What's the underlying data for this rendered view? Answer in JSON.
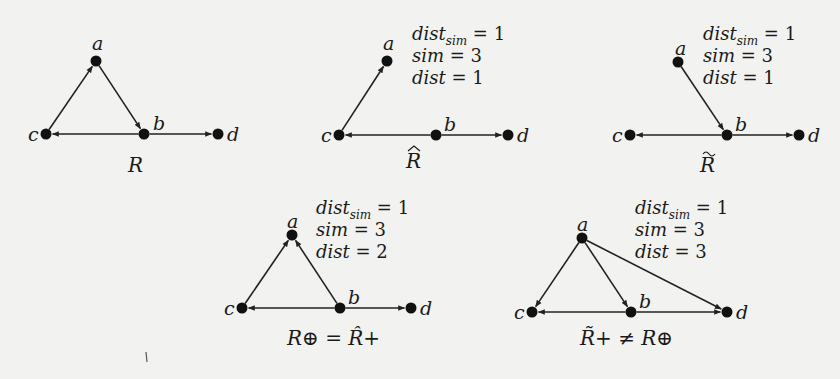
{
  "figure": {
    "background": "#f2f2f0",
    "ink_color": "#1a1a1a",
    "graphs": [
      {
        "id": "R",
        "caption": "R",
        "caption_x": 128,
        "caption_y": 172,
        "nodes": [
          {
            "name": "a",
            "x": 96,
            "y": 61,
            "lx": 92,
            "ly": 50
          },
          {
            "name": "b",
            "x": 144,
            "y": 134,
            "lx": 153,
            "ly": 130
          },
          {
            "name": "c",
            "x": 46,
            "y": 134,
            "lx": 28,
            "ly": 141
          },
          {
            "name": "d",
            "x": 218,
            "y": 134,
            "lx": 227,
            "ly": 141
          }
        ],
        "edges": [
          {
            "from": "c",
            "to": "a"
          },
          {
            "from": "a",
            "to": "b"
          },
          {
            "from": "b",
            "to": "c"
          },
          {
            "from": "b",
            "to": "d"
          }
        ],
        "stats": null
      },
      {
        "id": "R-hat",
        "caption": "R",
        "caption_accent": "hat",
        "caption_x": 406,
        "caption_y": 168,
        "nodes": [
          {
            "name": "a",
            "x": 387,
            "y": 61,
            "lx": 383,
            "ly": 50
          },
          {
            "name": "b",
            "x": 436,
            "y": 135,
            "lx": 444,
            "ly": 131
          },
          {
            "name": "c",
            "x": 339,
            "y": 135,
            "lx": 321,
            "ly": 142
          },
          {
            "name": "d",
            "x": 508,
            "y": 135,
            "lx": 517,
            "ly": 142
          }
        ],
        "edges": [
          {
            "from": "c",
            "to": "a"
          },
          {
            "from": "b",
            "to": "c"
          },
          {
            "from": "b",
            "to": "d"
          }
        ],
        "stats": {
          "x": 412,
          "dist_sim": "1",
          "sim": "3",
          "dist": "1",
          "y0": 40
        }
      },
      {
        "id": "R-tilde",
        "caption": "R",
        "caption_accent": "tilde",
        "caption_x": 700,
        "caption_y": 172,
        "nodes": [
          {
            "name": "a",
            "x": 678,
            "y": 62,
            "lx": 675,
            "ly": 55
          },
          {
            "name": "b",
            "x": 727,
            "y": 135,
            "lx": 735,
            "ly": 131
          },
          {
            "name": "c",
            "x": 630,
            "y": 135,
            "lx": 612,
            "ly": 142
          },
          {
            "name": "d",
            "x": 799,
            "y": 135,
            "lx": 808,
            "ly": 142
          }
        ],
        "edges": [
          {
            "from": "a",
            "to": "b"
          },
          {
            "from": "b",
            "to": "c"
          },
          {
            "from": "b",
            "to": "d"
          }
        ],
        "stats": {
          "x": 703,
          "dist_sim": "1",
          "sim": "3",
          "dist": "1",
          "y0": 40
        }
      },
      {
        "id": "R-oplus",
        "caption": "R⊕ = R̂+",
        "caption_x": 287,
        "caption_y": 345,
        "nodes": [
          {
            "name": "a",
            "x": 292,
            "y": 235,
            "lx": 287,
            "ly": 228
          },
          {
            "name": "b",
            "x": 340,
            "y": 308,
            "lx": 348,
            "ly": 304
          },
          {
            "name": "c",
            "x": 242,
            "y": 308,
            "lx": 224,
            "ly": 315
          },
          {
            "name": "d",
            "x": 411,
            "y": 308,
            "lx": 420,
            "ly": 315
          }
        ],
        "edges": [
          {
            "from": "c",
            "to": "a"
          },
          {
            "from": "b",
            "to": "a"
          },
          {
            "from": "b",
            "to": "c"
          },
          {
            "from": "b",
            "to": "d"
          }
        ],
        "stats": {
          "x": 316,
          "dist_sim": "1",
          "sim": "3",
          "dist": "2",
          "y0": 214
        }
      },
      {
        "id": "R-tilde-plus",
        "caption": "R̃+ ≠ R⊕",
        "caption_x": 580,
        "caption_y": 345,
        "nodes": [
          {
            "name": "a",
            "x": 582,
            "y": 238,
            "lx": 577,
            "ly": 231
          },
          {
            "name": "b",
            "x": 631,
            "y": 312,
            "lx": 639,
            "ly": 308
          },
          {
            "name": "c",
            "x": 532,
            "y": 312,
            "lx": 514,
            "ly": 319
          },
          {
            "name": "d",
            "x": 727,
            "y": 312,
            "lx": 736,
            "ly": 319
          }
        ],
        "edges": [
          {
            "from": "a",
            "to": "c"
          },
          {
            "from": "a",
            "to": "b"
          },
          {
            "from": "a",
            "to": "d"
          },
          {
            "from": "b",
            "to": "c"
          },
          {
            "from": "b",
            "to": "d"
          }
        ],
        "stats": {
          "x": 635,
          "dist_sim": "1",
          "sim": "3",
          "dist": "3",
          "y0": 214
        }
      }
    ],
    "labels": {
      "dist_sim_base": "dist",
      "dist_sim_sub": "sim",
      "sim": "sim",
      "dist": "dist",
      "equals": " = "
    }
  }
}
